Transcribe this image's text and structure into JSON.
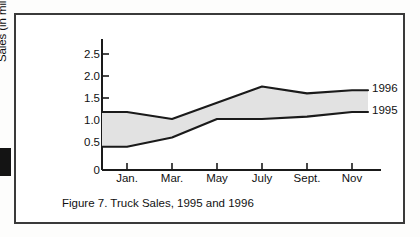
{
  "figure": {
    "caption": "Figure 7. Truck Sales, 1995 and 1996",
    "border_color": "#3a3a3a",
    "background": "#ffffff"
  },
  "chart_data": {
    "type": "area",
    "title": "",
    "subtitle": "",
    "xlabel": "",
    "ylabel": "Sales (in millions)",
    "ylim": [
      0,
      2.75
    ],
    "yticks": [
      0,
      0.5,
      1.0,
      1.5,
      2.0,
      2.5
    ],
    "ytick_labels": [
      "0",
      "0.5",
      "1.0",
      "1.5",
      "2.0",
      "2.5"
    ],
    "categories": [
      "Jan.",
      "Mar.",
      "May",
      "July",
      "Sept.",
      "Nov"
    ],
    "xtick_labels": [
      "Jan.",
      "Mar.",
      "May",
      "July",
      "Sept.",
      "Nov"
    ],
    "grid": false,
    "legend_position": "right-inline",
    "band_fill": "#e2e2e2",
    "line_color": "#1a1a1a",
    "series": [
      {
        "name": "1996",
        "label": "1996",
        "values": [
          1.25,
          1.1,
          1.45,
          1.8,
          1.65,
          1.72
        ],
        "x_positions": [
          0,
          1,
          2,
          3,
          4,
          5
        ]
      },
      {
        "name": "1995",
        "label": "1995",
        "values": [
          0.5,
          0.7,
          1.1,
          1.1,
          1.15,
          1.25
        ],
        "x_positions": [
          0,
          1,
          2,
          3,
          4,
          5
        ]
      }
    ],
    "annotations": [
      {
        "text": "1996",
        "attached_to": "1996"
      },
      {
        "text": "1995",
        "attached_to": "1995"
      }
    ]
  }
}
